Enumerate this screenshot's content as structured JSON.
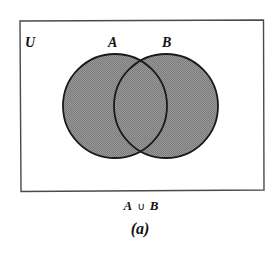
{
  "diagram": {
    "type": "venn",
    "universe_label": "U",
    "sets": [
      {
        "label": "A",
        "cx": 115,
        "cy": 106,
        "r": 52
      },
      {
        "label": "B",
        "cx": 166,
        "cy": 106,
        "r": 52
      }
    ],
    "shaded_region": "A ∪ B",
    "caption": {
      "expression_left": "A",
      "operator": "∪",
      "expression_right": "B",
      "sublabel": "(a)"
    },
    "colors": {
      "fill": "#8c8c8c",
      "stroke": "#1a1a1a",
      "frame": "#4a4a4a",
      "background": "#ffffff",
      "text": "#111111"
    }
  }
}
